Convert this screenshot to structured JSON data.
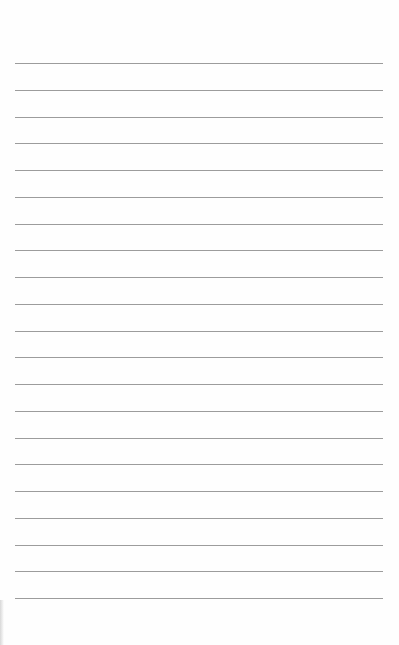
{
  "page": {
    "type": "blank lined paper",
    "background_color": "#fefefe",
    "rule_color": "#9c9c9c",
    "rule_count": 21,
    "first_rule_y": 63,
    "rule_spacing": 26.75,
    "rule_left": 15,
    "rule_width": 368
  }
}
